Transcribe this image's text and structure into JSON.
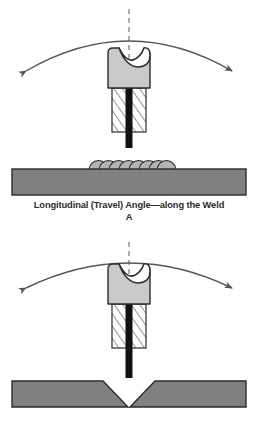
{
  "figure": {
    "background_color": "#ffffff"
  },
  "colors": {
    "plate_fill": "#808080",
    "plate_stroke": "#2b2b2b",
    "holder_fill": "#c9c9c9",
    "holder_stroke": "#2b2b2b",
    "collet_fill": "#ffffff",
    "collet_hatch": "#2b2b2b",
    "electrode": "#111111",
    "bead_fill": "#b3b3b3",
    "bead_stroke": "#2b2b2b",
    "arrow": "#555555",
    "centerline": "#888888",
    "caption_text": "#2b2b2b"
  },
  "panels": [
    {
      "id": "A",
      "letter": "A",
      "caption": "Longitudinal (Travel) Angle—along the Weld",
      "motion": "double-headed curved arrow sweeping left and right over the torch",
      "workpiece": "flat plate with weld bead",
      "bead_segments": 8,
      "parts": {
        "holder": "electrode holder body",
        "collet": "hatched collet / chuck section",
        "electrode": "electrode rod",
        "centerline": "vertical dashed reference centerline",
        "plate": "base metal plate",
        "bead": "weld bead ripples"
      }
    },
    {
      "id": "B",
      "letter": "B",
      "caption": "Transverse (Work) Angle—across the Weld",
      "motion": "double-headed curved arrow sweeping left and right over the torch",
      "workpiece": "V-groove butt joint",
      "bead_segments": 0,
      "parts": {
        "holder": "electrode holder body",
        "collet": "hatched collet / chuck section",
        "electrode": "electrode rod",
        "centerline": "vertical dashed reference centerline",
        "plate": "V-groove joint plates"
      }
    }
  ]
}
